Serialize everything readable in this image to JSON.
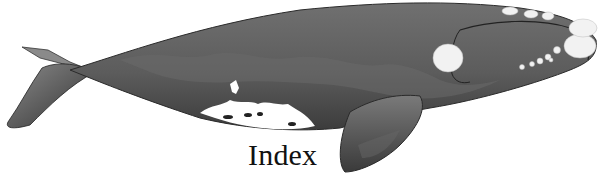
{
  "banner": {
    "caption": "Index",
    "image_subject": "right-whale-illustration",
    "colors": {
      "body_dark": "#3a3a3a",
      "body_mid": "#5e5e5e",
      "body_light": "#7a7a7a",
      "callosity": "#f2f2f2",
      "text": "#111111"
    }
  }
}
